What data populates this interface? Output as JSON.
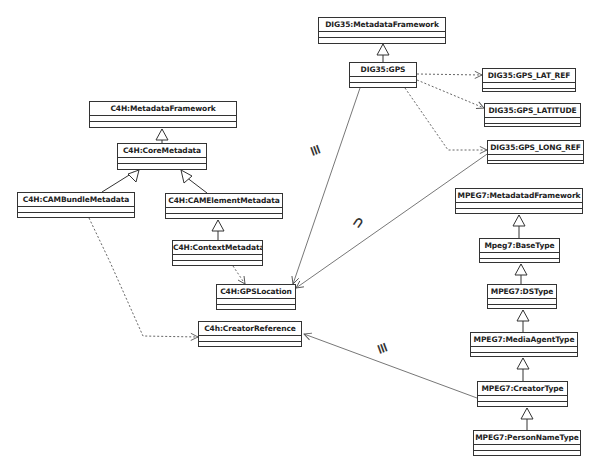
{
  "header": {
    "caption": "Figure 4. Excerpt of the C4H Metadata Framework integration with DIG35 and MPEG-7"
  },
  "classes": {
    "dig35_framework": "DIG35:MetadataFramework",
    "dig35_gps": "DIG35:GPS",
    "dig35_lat_ref": "DIG35:GPS_LAT_REF",
    "dig35_latitude": "DIG35:GPS_LATITUDE",
    "dig35_long_ref": "DIG35:GPS_LONG_REF",
    "c4h_framework": "C4H:MetadataFramework",
    "c4h_core": "C4H:CoreMetadata",
    "c4h_cam_bundle": "C4H:CAMBundleMetadata",
    "c4h_cam_element": "C4H:CAMElementMetadata",
    "c4h_context": "C4H:ContextMetadata",
    "c4h_gps_location": "C4H:GPSLocation",
    "c4h_creator_ref": "C4h:CreatorReference",
    "mpeg7_framework": "MPEG7:MetadatadFramework",
    "mpeg7_base": "Mpeg7:BaseType",
    "mpeg7_ds": "MPEG7:DSType",
    "mpeg7_media_agent": "MPEG7:MediaAgentType",
    "mpeg7_creator": "MPEG7:CreatorType",
    "mpeg7_person_name": "MPEG7:PersonNameType"
  },
  "relations": {
    "gps_to_gpslocation": "≡",
    "longref_to_gpslocation": "⊃",
    "creator_to_creatorref": "≡"
  },
  "colors": {
    "line": "#555555",
    "box_border": "#333333"
  }
}
